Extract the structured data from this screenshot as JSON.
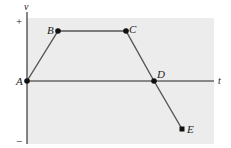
{
  "diagram": {
    "type": "velocity-time graph",
    "axes": {
      "vertical_label": "v",
      "horizontal_label": "t",
      "positive_marker": "+",
      "negative_marker": "−"
    },
    "points": [
      {
        "label": "A",
        "x": 27,
        "y": 81
      },
      {
        "label": "B",
        "x": 58,
        "y": 31
      },
      {
        "label": "C",
        "x": 126,
        "y": 31
      },
      {
        "label": "D",
        "x": 154,
        "y": 81
      },
      {
        "label": "E",
        "x": 182,
        "y": 129
      }
    ],
    "colors": {
      "background": "#ececec",
      "axis": "#555555",
      "line": "#555555",
      "point": "#111111"
    }
  }
}
